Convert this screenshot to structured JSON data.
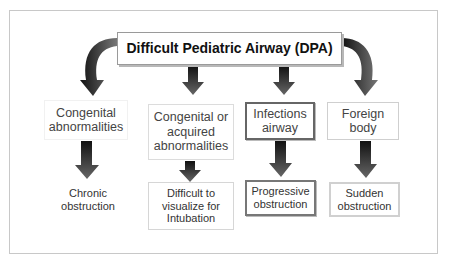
{
  "diagram": {
    "title": "Difficult Pediatric Airway (DPA)",
    "categories": [
      {
        "label_lines": [
          "Congenital",
          "abnormalities"
        ],
        "outcome_lines": [
          "Chronic",
          "obstruction"
        ]
      },
      {
        "label_lines": [
          "Congenital or",
          "acquired",
          "abnormalities"
        ],
        "outcome_lines": [
          "Difficult to",
          "visualize for",
          "Intubation"
        ]
      },
      {
        "label_lines": [
          "Infections",
          "airway"
        ],
        "outcome_lines": [
          "Progressive",
          "obstruction"
        ]
      },
      {
        "label_lines": [
          "Foreign",
          "body"
        ],
        "outcome_lines": [
          "Sudden",
          "obstruction"
        ]
      }
    ],
    "colors": {
      "arrow_dark": "#1a1a1a",
      "arrow_light": "#8a8a8a",
      "border": "#9a9a9a"
    }
  }
}
